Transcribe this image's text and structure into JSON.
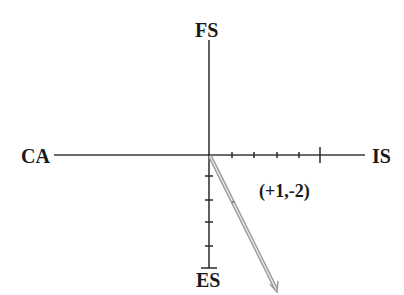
{
  "diagram": {
    "axes": {
      "top_label": "FS",
      "bottom_label": "ES",
      "left_label": "CA",
      "right_label": "IS"
    },
    "vector": {
      "label": "(+1,-2)",
      "x": 1,
      "y": -2
    },
    "colors": {
      "axis": "#2a2a2a",
      "vector": "#a8a8a8",
      "text": "#1a1a1a"
    },
    "positive_x_ticks": 5,
    "negative_y_ticks": 5
  }
}
